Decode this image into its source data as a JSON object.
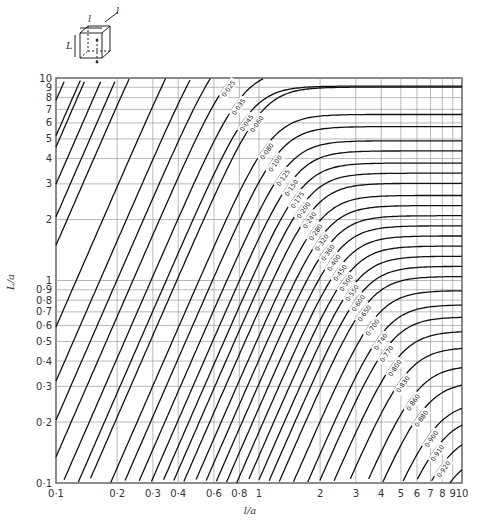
{
  "chart_data": {
    "type": "line",
    "title": "",
    "subtitle": "Configuration factor chart (parallelepiped / cube geometry)",
    "xlabel": "l/a",
    "ylabel": "L/a",
    "xscale": "log",
    "yscale": "log",
    "xlim": [
      0.1,
      10
    ],
    "ylim": [
      0.1,
      10
    ],
    "grid": true,
    "legend": "none (contour labels inline)",
    "x_ticks": [
      "0·1",
      "0·2",
      "0·3",
      "0·4",
      "0·6",
      "0·8",
      "1",
      "2",
      "3",
      "4",
      "5",
      "6",
      "7",
      "8",
      "9",
      "10"
    ],
    "x_tick_values": [
      0.1,
      0.2,
      0.3,
      0.4,
      0.6,
      0.8,
      1,
      2,
      3,
      4,
      5,
      6,
      7,
      8,
      9,
      10
    ],
    "y_ticks": [
      "0·1",
      "0·2",
      "0·3",
      "0·4",
      "0·5",
      "0·6",
      "0·7",
      "0·8",
      "0·9",
      "1",
      "2",
      "3",
      "4",
      "5",
      "6",
      "7",
      "8",
      "9",
      "10"
    ],
    "y_tick_values": [
      0.1,
      0.2,
      0.3,
      0.4,
      0.5,
      0.6,
      0.7,
      0.8,
      0.9,
      1,
      2,
      3,
      4,
      5,
      6,
      7,
      8,
      9,
      10
    ],
    "contour_labels": [
      "0·002",
      "0·005",
      "0·010",
      "0·015",
      "0·020",
      "0·025",
      "0·035",
      "0·045",
      "0·060",
      "0·080",
      "0·100",
      "0·125",
      "0·150",
      "0·175",
      "0·200",
      "0·240",
      "0·280",
      "0·320",
      "0·360",
      "0·400",
      "0·450",
      "0·500",
      "0·550",
      "0·600",
      "0·650",
      "0·700",
      "0·740",
      "0·770",
      "0·800",
      "0·830",
      "0·860",
      "0·880",
      "0·900",
      "0·910",
      "0·920",
      "0·930"
    ],
    "series_model": {
      "description": "Each contour: steep log-log line (slope ~2.3) at small l/a bending to horizontal asymptote L/a = plateau at large l/a",
      "slope": 2.3,
      "softness": 0.18,
      "contours": [
        {
          "label": "0·002",
          "knee_u": -0.55,
          "plateau_v": 1.75
        },
        {
          "label": "0·005",
          "knee_u": -0.38,
          "plateau_v": 1.6
        },
        {
          "label": "0·010",
          "knee_u": -0.27,
          "plateau_v": 1.45
        },
        {
          "label": "0·015",
          "knee_u": -0.21,
          "plateau_v": 1.32
        },
        {
          "label": "0·020",
          "knee_u": -0.17,
          "plateau_v": 1.22
        },
        {
          "label": "0·025",
          "knee_u": -0.13,
          "plateau_v": 1.13
        },
        {
          "label": "0·035",
          "knee_u": -0.08,
          "plateau_v": 1.04
        },
        {
          "label": "0·045",
          "knee_u": -0.04,
          "plateau_v": 0.96
        },
        {
          "label": "0·060",
          "knee_u": 0.01,
          "plateau_v": 0.955
        },
        {
          "label": "0·080",
          "knee_u": 0.06,
          "plateau_v": 0.82
        },
        {
          "label": "0·100",
          "knee_u": 0.1,
          "plateau_v": 0.76
        },
        {
          "label": "0·125",
          "knee_u": 0.14,
          "plateau_v": 0.69
        },
        {
          "label": "0·150",
          "knee_u": 0.18,
          "plateau_v": 0.64
        },
        {
          "label": "0·175",
          "knee_u": 0.21,
          "plateau_v": 0.58
        },
        {
          "label": "0·200",
          "knee_u": 0.24,
          "plateau_v": 0.53
        },
        {
          "label": "0·240",
          "knee_u": 0.27,
          "plateau_v": 0.48
        },
        {
          "label": "0·280",
          "knee_u": 0.3,
          "plateau_v": 0.42
        },
        {
          "label": "0·320",
          "knee_u": 0.33,
          "plateau_v": 0.37
        },
        {
          "label": "0·360",
          "knee_u": 0.36,
          "plateau_v": 0.32
        },
        {
          "label": "0·400",
          "knee_u": 0.39,
          "plateau_v": 0.27
        },
        {
          "label": "0·450",
          "knee_u": 0.42,
          "plateau_v": 0.22
        },
        {
          "label": "0·500",
          "knee_u": 0.45,
          "plateau_v": 0.17
        },
        {
          "label": "0·550",
          "knee_u": 0.48,
          "plateau_v": 0.12
        },
        {
          "label": "0·600",
          "knee_u": 0.51,
          "plateau_v": 0.07
        },
        {
          "label": "0·650",
          "knee_u": 0.54,
          "plateau_v": 0.02
        },
        {
          "label": "0·700",
          "knee_u": 0.58,
          "plateau_v": -0.05
        },
        {
          "label": "0·740",
          "knee_u": 0.62,
          "plateau_v": -0.12
        },
        {
          "label": "0·770",
          "knee_u": 0.65,
          "plateau_v": -0.18
        },
        {
          "label": "0·800",
          "knee_u": 0.69,
          "plateau_v": -0.25
        },
        {
          "label": "0·830",
          "knee_u": 0.73,
          "plateau_v": -0.33
        },
        {
          "label": "0·860",
          "knee_u": 0.78,
          "plateau_v": -0.42
        },
        {
          "label": "0·880",
          "knee_u": 0.82,
          "plateau_v": -0.5
        },
        {
          "label": "0·900",
          "knee_u": 0.87,
          "plateau_v": -0.6
        },
        {
          "label": "0·910",
          "knee_u": 0.9,
          "plateau_v": -0.67
        },
        {
          "label": "0·920",
          "knee_u": 0.93,
          "plateau_v": -0.75
        },
        {
          "label": "0·930",
          "knee_u": 0.96,
          "plateau_v": -0.85
        }
      ],
      "extra_unlabeled_steep_lines_u_offsets": [
        -1.3,
        -1.15,
        -1.0,
        -0.9,
        -0.8,
        -0.72,
        -0.65
      ]
    }
  },
  "inset": {
    "description": "Cube schematic with dimensions",
    "dim_width": "l",
    "dim_depth": "l",
    "dim_height": "L"
  },
  "axes": {
    "x_label": "l/a",
    "y_label": "L/a"
  }
}
